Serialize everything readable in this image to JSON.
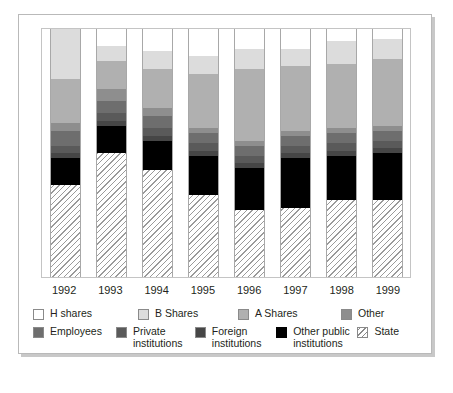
{
  "chart_data": {
    "type": "bar",
    "subtype": "stacked-percentage",
    "title": "",
    "xlabel": "",
    "ylabel": "",
    "ylim": [
      0,
      100
    ],
    "grid": false,
    "legend_position": "bottom",
    "categories": [
      "1992",
      "1993",
      "1994",
      "1995",
      "1996",
      "1997",
      "1998",
      "1999"
    ],
    "series": [
      {
        "name": "H shares",
        "color": "#ffffff",
        "values": [
          0,
          7,
          9,
          11,
          8,
          8,
          5,
          4
        ]
      },
      {
        "name": "B Shares",
        "color": "#dcdcdc",
        "values": [
          20,
          6,
          7,
          7,
          8,
          7,
          9,
          8
        ]
      },
      {
        "name": "A Shares",
        "color": "#b0b0b0",
        "values": [
          18,
          11,
          16,
          22,
          29,
          26,
          26,
          27
        ]
      },
      {
        "name": "Other",
        "color": "#8e8e8e",
        "values": [
          3,
          5,
          3,
          2,
          2,
          2,
          2,
          2
        ]
      },
      {
        "name": "Employees",
        "color": "#6e6e6e",
        "values": [
          6,
          5,
          5,
          4,
          4,
          4,
          4,
          4
        ]
      },
      {
        "name": "Private institutions",
        "color": "#5a5a5a",
        "values": [
          3,
          3,
          3,
          3,
          3,
          3,
          3,
          3
        ]
      },
      {
        "name": "Foreign institutions",
        "color": "#464646",
        "values": [
          2,
          2,
          2,
          2,
          2,
          2,
          2,
          2
        ]
      },
      {
        "name": "Other public institutions",
        "color": "#000000",
        "values": [
          11,
          11,
          12,
          16,
          17,
          20,
          18,
          19
        ]
      },
      {
        "name": "State",
        "color": "#ffffff",
        "pattern": "diagonal-hatch",
        "values": [
          37,
          50,
          43,
          33,
          27,
          28,
          31,
          31
        ]
      }
    ]
  },
  "axis": {
    "x_tick_labels": [
      "1992",
      "1993",
      "1994",
      "1995",
      "1996",
      "1997",
      "1998",
      "1999"
    ]
  },
  "legend": {
    "row1": [
      {
        "label": "H shares",
        "swatch": "swatch-h-shares"
      },
      {
        "label": "B Shares",
        "swatch": "swatch-b-shares"
      },
      {
        "label": "A Shares",
        "swatch": "swatch-a-shares"
      },
      {
        "label": "Other",
        "swatch": "swatch-other"
      }
    ],
    "row2": [
      {
        "label": "Employees",
        "swatch": "swatch-employees"
      },
      {
        "label": "Private\ninstitutions",
        "swatch": "swatch-private-institutions"
      },
      {
        "label": "Foreign\ninstitutions",
        "swatch": "swatch-foreign-institutions"
      },
      {
        "label": "Other public\ninstitutions",
        "swatch": "swatch-other-public-institutions"
      },
      {
        "label": "State",
        "swatch": "swatch-state"
      }
    ]
  },
  "caption": {
    "text": ""
  },
  "colors": {
    "h_shares": "#ffffff",
    "b_shares": "#dcdcdc",
    "a_shares": "#b0b0b0",
    "other": "#8e8e8e",
    "employees": "#6e6e6e",
    "private_institutions": "#5a5a5a",
    "foreign_institutions": "#464646",
    "other_public_institutions": "#000000",
    "state": "#ffffff",
    "frame": "#b9b9b9",
    "plot_border": "#c4c4c4",
    "text": "#231f20"
  }
}
